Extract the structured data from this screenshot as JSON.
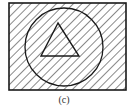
{
  "figure": {
    "caption": "(c)",
    "shapes": {
      "outer_set": "rectangle",
      "middle_set": "circle",
      "inner_set": "triangle"
    },
    "shading": "entire rectangle hatched (including circle and triangle)",
    "colors": {
      "stroke": "#1a1a1a",
      "hatch": "#3a3a3a",
      "background": "#ffffff"
    }
  }
}
